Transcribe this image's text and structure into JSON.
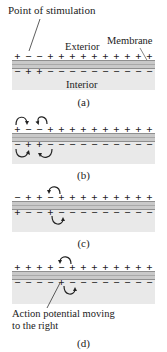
{
  "labels": {
    "point_of_stimulation": "Point of stimulation",
    "exterior": "Exterior",
    "membrane": "Membrane",
    "interior": "Interior",
    "action_potential": "Action potential moving",
    "action_potential_2": "to the right"
  },
  "panels": [
    {
      "caption": "(a)",
      "exterior_charges": [
        "+",
        "−",
        "−",
        "+",
        "+",
        "+",
        "+",
        "+",
        "+",
        "+",
        "+",
        "+",
        "+"
      ],
      "interior_charges": [
        "−",
        "+",
        "+",
        "−",
        "−",
        "−",
        "−",
        "−",
        "−",
        "−",
        "−",
        "−",
        "−"
      ]
    },
    {
      "caption": "(b)",
      "exterior_charges": [
        "+",
        "−",
        "−",
        "+",
        "+",
        "+",
        "+",
        "+",
        "+",
        "+",
        "+",
        "+",
        "+"
      ],
      "interior_charges": [
        "−",
        "+",
        "+",
        "−",
        "−",
        "−",
        "−",
        "−",
        "−",
        "−",
        "−",
        "−",
        "−"
      ]
    },
    {
      "caption": "(c)",
      "exterior_charges": [
        "−",
        "+",
        "+",
        "−",
        "+",
        "+",
        "+",
        "+",
        "+",
        "+",
        "+",
        "+",
        "+"
      ],
      "interior_charges": [
        "+",
        "−",
        "−",
        "+",
        "−",
        "−",
        "−",
        "−",
        "−",
        "−",
        "−",
        "−",
        "−"
      ]
    },
    {
      "caption": "(d)",
      "exterior_charges": [
        "+",
        "+",
        "+",
        "+",
        "−",
        "+",
        "+",
        "+",
        "+",
        "+",
        "+",
        "+",
        "+"
      ],
      "interior_charges": [
        "−",
        "−",
        "−",
        "−",
        "+",
        "−",
        "−",
        "−",
        "−",
        "−",
        "−",
        "−",
        "−"
      ]
    }
  ],
  "colors": {
    "membrane": "#c9c9c9",
    "membrane_border": "#8f8f8f",
    "interior": "#e9e9e9"
  }
}
